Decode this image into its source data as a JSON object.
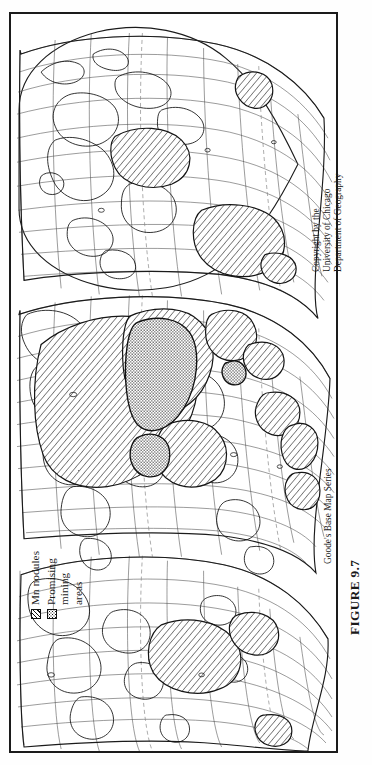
{
  "figure": {
    "caption": "FIGURE 9.7",
    "series_credit": "Goode's Base Map Series",
    "copyright": {
      "line1": "Copyright by the",
      "line2": "University of Chicago",
      "line3": "Department of Geography"
    }
  },
  "legend": {
    "items": [
      {
        "label": "Mn nodules",
        "label_line2": "",
        "pattern": "diagonal-hatch",
        "swatch_icon": "hatched-square-icon"
      },
      {
        "label": "Promising",
        "label_line2": "mining",
        "label_line3": "areas",
        "pattern": "stipple",
        "swatch_icon": "stippled-square-icon"
      }
    ]
  },
  "map": {
    "projection": "Goode's interrupted homolosine",
    "orientation_degrees": 90,
    "graticule": {
      "parallel_spacing_degrees": 15,
      "meridian_spacing_degrees": 15
    },
    "colors": {
      "ink": "#1b1b1b",
      "graticule": "#4a4a4a",
      "coastline": "#111111",
      "frame": "#1b1b1b",
      "paper": "#ffffff",
      "dashed_boundary": "#777777"
    },
    "features": [
      {
        "name": "north-pacific-nodule-field",
        "pattern": "diagonal-hatch"
      },
      {
        "name": "clarion-clipperton-zone",
        "pattern": "diagonal-hatch"
      },
      {
        "name": "prime-mining-area",
        "pattern": "stipple"
      },
      {
        "name": "south-pacific-nodule-field",
        "pattern": "diagonal-hatch"
      },
      {
        "name": "indian-ocean-nodule-field",
        "pattern": "diagonal-hatch"
      },
      {
        "name": "north-atlantic-nodule-field",
        "pattern": "diagonal-hatch"
      },
      {
        "name": "south-atlantic-nodule-field",
        "pattern": "diagonal-hatch"
      },
      {
        "name": "peru-basin-nodule-field",
        "pattern": "diagonal-hatch"
      },
      {
        "name": "southern-ocean-nodule-field",
        "pattern": "diagonal-hatch"
      }
    ]
  }
}
